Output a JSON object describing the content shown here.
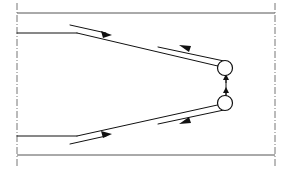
{
  "diagram": {
    "title": "Symmetric V-path routing diagram with twin pulleys",
    "type": "technical-line-drawing",
    "canvas": {
      "width": 288,
      "height": 171
    },
    "colors": {
      "background": "#ffffff",
      "frame": "#555555",
      "centerline": "#777777",
      "path": "#111111",
      "arrow": "#111111",
      "pulley_fill": "#ffffff"
    },
    "frame": {
      "top_outer_line": {
        "x1": 17,
        "y1": 13,
        "x2": 275,
        "y2": 13
      },
      "bottom_outer_line": {
        "x1": 17,
        "y1": 155,
        "x2": 275,
        "y2": 155
      },
      "left_centerline": {
        "x1": 17,
        "y1": 4,
        "x2": 17,
        "y2": 167
      },
      "right_centerline": {
        "x1": 275,
        "y1": 4,
        "x2": 275,
        "y2": 167
      }
    },
    "guide_lines": {
      "upper_horizontal": {
        "x1": 17,
        "y1": 33,
        "x2": 76,
        "y2": 33
      },
      "lower_horizontal": {
        "x1": 17,
        "y1": 136,
        "x2": 76,
        "y2": 136
      }
    },
    "main_path": {
      "upper_outbound": [
        {
          "x": 76,
          "y": 33
        },
        {
          "x": 224,
          "y": 68
        }
      ],
      "upper_return": [
        {
          "x": 224,
          "y": 62
        },
        {
          "x": 160,
          "y": 48
        }
      ],
      "lower_outbound": [
        {
          "x": 76,
          "y": 136
        },
        {
          "x": 224,
          "y": 103
        }
      ],
      "lower_return": [
        {
          "x": 224,
          "y": 110
        },
        {
          "x": 160,
          "y": 124
        }
      ]
    },
    "pulleys": [
      {
        "name": "upper-pulley",
        "cx": 225,
        "cy": 68,
        "r": 7.5
      },
      {
        "name": "lower-pulley",
        "cx": 225,
        "cy": 103,
        "r": 7.5
      }
    ],
    "connector": {
      "name": "vertical-connector",
      "x": 226,
      "y_top": 70,
      "y_bottom": 101
    },
    "flow_arrows": [
      {
        "name": "top-inlet-flow-arrow",
        "direction": "right",
        "from": {
          "x": 72,
          "y": 26
        },
        "to": {
          "x": 112,
          "y": 35
        },
        "label": "inlet flow (top)"
      },
      {
        "name": "bottom-inlet-flow-arrow",
        "direction": "right",
        "from": {
          "x": 72,
          "y": 143
        },
        "to": {
          "x": 112,
          "y": 134
        },
        "label": "inlet flow (bottom)"
      },
      {
        "name": "top-return-flow-arrow",
        "direction": "left",
        "at": {
          "x": 186,
          "y": 47
        },
        "label": "return flow (top)"
      },
      {
        "name": "bottom-return-flow-arrow",
        "direction": "left",
        "at": {
          "x": 186,
          "y": 121
        },
        "label": "return flow (bottom)"
      },
      {
        "name": "connector-up-arrow",
        "direction": "up",
        "at": {
          "x": 226,
          "y": 79
        },
        "label": "connector travel up"
      },
      {
        "name": "connector-down-arrow",
        "direction": "up",
        "at": {
          "x": 226,
          "y": 92
        },
        "label": "connector travel"
      }
    ]
  }
}
